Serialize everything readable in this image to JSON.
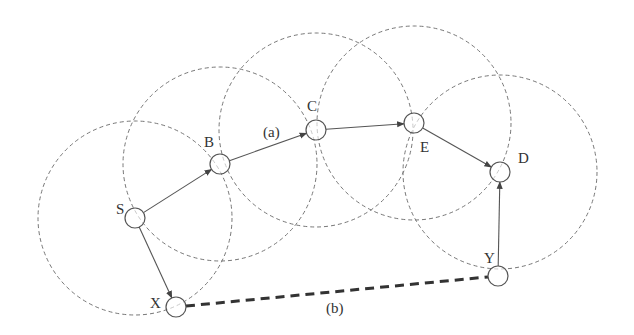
{
  "diagram": {
    "nodes": [
      {
        "id": "S",
        "label": "S",
        "x": 135,
        "y": 218,
        "lx": 116,
        "ly": 214
      },
      {
        "id": "B",
        "label": "B",
        "x": 220,
        "y": 164,
        "lx": 204,
        "ly": 147
      },
      {
        "id": "C",
        "label": "C",
        "x": 316,
        "y": 130,
        "lx": 307,
        "ly": 111
      },
      {
        "id": "E",
        "label": "E",
        "x": 414,
        "y": 123,
        "lx": 420,
        "ly": 152
      },
      {
        "id": "D",
        "label": "D",
        "x": 500,
        "y": 172,
        "lx": 518,
        "ly": 163
      },
      {
        "id": "Y",
        "label": "Y",
        "x": 498,
        "y": 276,
        "lx": 484,
        "ly": 263
      },
      {
        "id": "X",
        "label": "X",
        "x": 176,
        "y": 307,
        "lx": 150,
        "ly": 308
      }
    ],
    "range_radius": 97,
    "node_radius": 10,
    "range_circles": [
      "S",
      "B",
      "C",
      "E",
      "D"
    ],
    "edges": [
      {
        "from": "S",
        "to": "B",
        "style": "arrow"
      },
      {
        "from": "B",
        "to": "C",
        "style": "arrow"
      },
      {
        "from": "C",
        "to": "E",
        "style": "arrow"
      },
      {
        "from": "E",
        "to": "D",
        "style": "arrow"
      },
      {
        "from": "S",
        "to": "X",
        "style": "arrow"
      },
      {
        "from": "Y",
        "to": "D",
        "style": "arrow"
      },
      {
        "from": "X",
        "to": "Y",
        "style": "thick-dashed"
      }
    ],
    "annotations": [
      {
        "text": "(a)",
        "x": 263,
        "y": 137
      },
      {
        "text": "(b)",
        "x": 326,
        "y": 313
      }
    ],
    "colors": {
      "stroke": "#555555",
      "range": "#777777",
      "text": "#333333"
    }
  }
}
